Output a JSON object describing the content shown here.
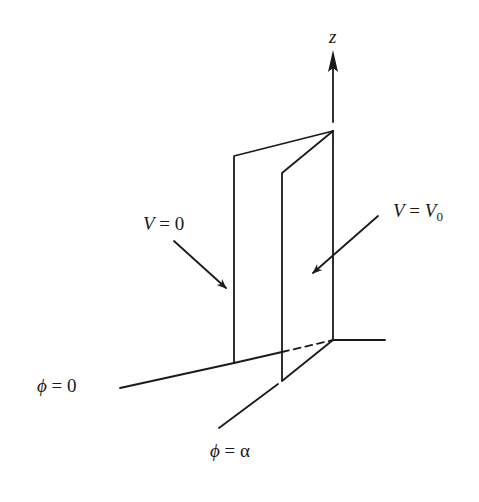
{
  "diagram": {
    "type": "wedge-of-two-conducting-planes",
    "axis": {
      "label": "z"
    },
    "planes": [
      {
        "name": "phi-zero-plane",
        "potential_label": {
          "var": "V",
          "eq": " = ",
          "value": "0"
        }
      },
      {
        "name": "phi-alpha-plane",
        "potential_label": {
          "var": "V",
          "eq": " = ",
          "value": "V",
          "value_sub": "0"
        }
      }
    ],
    "angle_labels": [
      {
        "var": "ϕ",
        "eq": " = ",
        "value": "0"
      },
      {
        "var": "ϕ",
        "eq": " = ",
        "value": "α"
      }
    ],
    "colors": {
      "stroke": "#1a1a1a",
      "background": "#ffffff"
    }
  }
}
